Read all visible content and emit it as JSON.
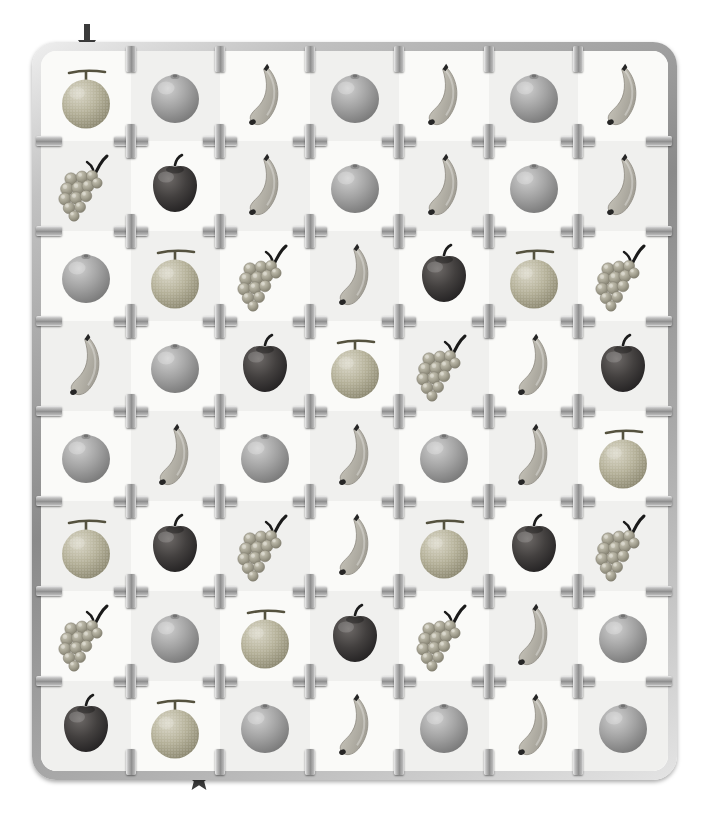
{
  "puzzle": {
    "title": "Fruit sprue grid puzzle",
    "grid": {
      "rows": 8,
      "cols": 7
    },
    "background_colors": {
      "light": "#fafaf8",
      "dark": "#f0f0ee",
      "panel": "#f7f7f5"
    },
    "frame": {
      "name": "plastic-model-sprue-frame",
      "metal_light": "#ededed",
      "metal_mid": "#909090",
      "metal_dark": "#6f6f6f"
    },
    "markers": [
      {
        "name": "start-arrow",
        "glyph": "down-arrow",
        "color": "#3a3a3a",
        "position": "top-edge-column-1"
      },
      {
        "name": "goal-star",
        "glyph": "five-point-star",
        "color": "#3a3a3a",
        "position": "bottom-edge-column-2"
      }
    ],
    "fruit_legend": [
      {
        "key": "melon",
        "label": "Melon",
        "color": "#b8b49f",
        "accent": "#8e8a76"
      },
      {
        "key": "orange",
        "label": "Orange",
        "color": "#a8a8a8",
        "accent": "#7d7d7d"
      },
      {
        "key": "banana",
        "label": "Banana",
        "color": "#bdbdb5",
        "accent": "#2b2b2b"
      },
      {
        "key": "apple",
        "label": "Apple",
        "color": "#4a4a4a",
        "accent": "#1d1d1d"
      },
      {
        "key": "grapes",
        "label": "Grapes",
        "color": "#a9a99b",
        "accent": "#202020"
      }
    ],
    "cells": [
      [
        "melon",
        "orange",
        "banana",
        "orange",
        "banana",
        "orange",
        "banana"
      ],
      [
        "grapes",
        "apple",
        "banana",
        "orange",
        "banana",
        "orange",
        "banana"
      ],
      [
        "orange",
        "melon",
        "grapes",
        "banana",
        "apple",
        "melon",
        "grapes"
      ],
      [
        "banana",
        "orange",
        "apple",
        "melon",
        "grapes",
        "banana",
        "apple"
      ],
      [
        "orange",
        "banana",
        "orange",
        "banana",
        "orange",
        "banana",
        "melon"
      ],
      [
        "melon",
        "apple",
        "grapes",
        "banana",
        "melon",
        "apple",
        "grapes"
      ],
      [
        "grapes",
        "orange",
        "melon",
        "apple",
        "grapes",
        "banana",
        "orange"
      ],
      [
        "apple",
        "melon",
        "orange",
        "banana",
        "orange",
        "banana",
        "orange"
      ]
    ]
  }
}
